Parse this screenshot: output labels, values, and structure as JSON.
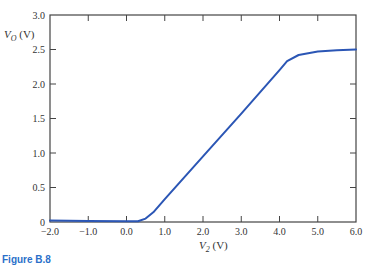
{
  "chart_data": {
    "type": "line",
    "title": "",
    "xlabel": "V2 (V)",
    "ylabel": "VO (V)",
    "xlim": [
      -2.0,
      6.0
    ],
    "ylim": [
      0,
      3.0
    ],
    "x_ticks": [
      "-2.0",
      "-1.0",
      "0.0",
      "1.0",
      "2.0",
      "3.0",
      "4.0",
      "5.0",
      "6.0"
    ],
    "y_ticks": [
      "0",
      "0.5",
      "1.0",
      "1.5",
      "2.0",
      "2.5",
      "3.0"
    ],
    "grid": false,
    "legend": null,
    "series": [
      {
        "name": "VO",
        "color": "#2b56b5",
        "x": [
          -2.0,
          -1.0,
          0.0,
          0.3,
          0.5,
          0.7,
          1.0,
          2.0,
          3.0,
          4.0,
          4.2,
          4.5,
          5.0,
          5.5,
          6.0
        ],
        "y": [
          0.02,
          0.015,
          0.01,
          0.01,
          0.05,
          0.14,
          0.33,
          0.95,
          1.57,
          2.2,
          2.33,
          2.42,
          2.47,
          2.49,
          2.5
        ]
      }
    ]
  },
  "labels": {
    "y_axis": "V",
    "y_sub": "O",
    "y_unit": " (V)",
    "x_axis": "V",
    "x_sub": "2",
    "x_unit": " (V)"
  },
  "caption": "Figure B.8"
}
